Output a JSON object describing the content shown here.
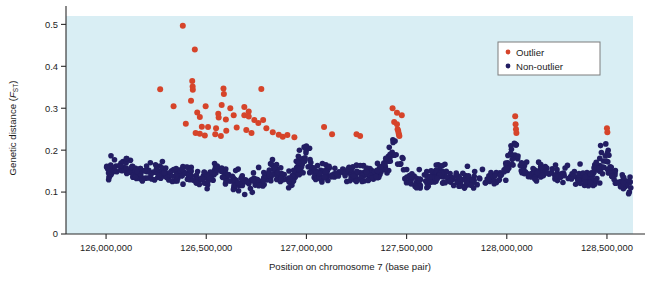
{
  "figure": {
    "title": "",
    "plot_area": {
      "x": 66,
      "y": 16,
      "width": 567,
      "height": 218,
      "background_color": "#d9eef4"
    }
  },
  "legend": {
    "position": "top-right",
    "box": {
      "x": 498,
      "y": 42,
      "width": 102,
      "height": 33
    },
    "entries": [
      {
        "label": "Outlier",
        "color": "#d6442a",
        "marker": "circle"
      },
      {
        "label": "Non-outlier",
        "color": "#221d62",
        "marker": "circle"
      }
    ]
  },
  "chart_data": {
    "type": "scatter",
    "title": "",
    "xlabel": "Position on chromosome 7 (base pair)",
    "ylabel": "Genetic distance (F_ST)",
    "ylabel_main": "Genetic distance (",
    "ylabel_italic": "F",
    "ylabel_sub": "ST",
    "ylabel_close": ")",
    "xlim": [
      125800000,
      128630000
    ],
    "ylim": [
      0,
      0.52
    ],
    "grid": false,
    "xticks": [
      126000000,
      126500000,
      127000000,
      127500000,
      128000000,
      128500000
    ],
    "xticklabels": [
      "126,000,000",
      "126,500,000",
      "127,000,000",
      "127,500,000",
      "128,000,000",
      "128,500,000"
    ],
    "yticks": [
      0,
      0.1,
      0.2,
      0.3,
      0.4,
      0.5
    ],
    "yticklabels": [
      "0",
      "0.1",
      "0.2",
      "0.3",
      "0.4",
      "0.5"
    ],
    "series": [
      {
        "name": "Outlier",
        "color": "#d6442a",
        "marker_size": 3.0,
        "points": [
          [
            126383000,
            0.497
          ],
          [
            126443000,
            0.44
          ],
          [
            126430000,
            0.365
          ],
          [
            126432000,
            0.352
          ],
          [
            126433000,
            0.344
          ],
          [
            126270000,
            0.345
          ],
          [
            126586000,
            0.347
          ],
          [
            126588000,
            0.334
          ],
          [
            126775000,
            0.346
          ],
          [
            126337000,
            0.305
          ],
          [
            126424000,
            0.318
          ],
          [
            126497000,
            0.305
          ],
          [
            126577000,
            0.308
          ],
          [
            126620000,
            0.3
          ],
          [
            126690000,
            0.303
          ],
          [
            126712000,
            0.292
          ],
          [
            126455000,
            0.29
          ],
          [
            126468000,
            0.279
          ],
          [
            126560000,
            0.287
          ],
          [
            126562000,
            0.278
          ],
          [
            126598000,
            0.273
          ],
          [
            126637000,
            0.283
          ],
          [
            126690000,
            0.283
          ],
          [
            126712000,
            0.28
          ],
          [
            126740000,
            0.272
          ],
          [
            126760000,
            0.265
          ],
          [
            126784000,
            0.272
          ],
          [
            126398000,
            0.263
          ],
          [
            126478000,
            0.256
          ],
          [
            126509000,
            0.255
          ],
          [
            126549000,
            0.252
          ],
          [
            126600000,
            0.246
          ],
          [
            126652000,
            0.254
          ],
          [
            126700000,
            0.248
          ],
          [
            126726000,
            0.241
          ],
          [
            126800000,
            0.252
          ],
          [
            126832000,
            0.243
          ],
          [
            126447000,
            0.241
          ],
          [
            126468000,
            0.239
          ],
          [
            126493000,
            0.235
          ],
          [
            126545000,
            0.238
          ],
          [
            126573000,
            0.234
          ],
          [
            126862000,
            0.237
          ],
          [
            126882000,
            0.232
          ],
          [
            126905000,
            0.236
          ],
          [
            126940000,
            0.231
          ],
          [
            127088000,
            0.255
          ],
          [
            127128000,
            0.238
          ],
          [
            127250000,
            0.238
          ],
          [
            127268000,
            0.234
          ],
          [
            127430000,
            0.3
          ],
          [
            127452000,
            0.289
          ],
          [
            127476000,
            0.283
          ],
          [
            127438000,
            0.267
          ],
          [
            127452000,
            0.262
          ],
          [
            127455000,
            0.25
          ],
          [
            127458000,
            0.246
          ],
          [
            127460000,
            0.241
          ],
          [
            127462000,
            0.237
          ],
          [
            127464000,
            0.234
          ],
          [
            128042000,
            0.281
          ],
          [
            128044000,
            0.262
          ],
          [
            128046000,
            0.25
          ],
          [
            128048000,
            0.241
          ],
          [
            128500000,
            0.252
          ],
          [
            128502000,
            0.243
          ]
        ]
      },
      {
        "name": "Non-outlier",
        "color": "#221d62",
        "marker_size": 2.8,
        "description": "Dense band of approximately 900 markers spanning 126,000,000-128,600,000 bp, concentrated between Fst 0.07 and 0.20, with local spikes up to 0.26 near 127,000,000, 127,450,000, 128,030,000 and 128,490,000.",
        "band": {
          "low": 0.07,
          "high": 0.2,
          "count": 900
        }
      }
    ]
  }
}
